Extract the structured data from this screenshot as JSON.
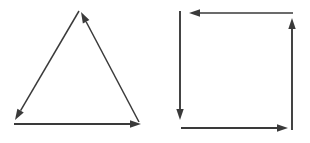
{
  "figure": {
    "background_color": "#ffffff",
    "stroke_color": "#3a3a3a",
    "width": 310,
    "height": 143,
    "panels": [
      {
        "name": "triangle-vector-loop",
        "shape": "triangle",
        "orientation": "counterclockwise",
        "vertices": [
          {
            "label": "apex",
            "x": 80,
            "y": 10
          },
          {
            "label": "bottom-left",
            "x": 14,
            "y": 124
          },
          {
            "label": "bottom-right",
            "x": 141,
            "y": 124
          }
        ],
        "vectors": [
          {
            "name": "bottom-edge-vector",
            "from_x": 14,
            "from_y": 124,
            "to_x": 141,
            "to_y": 124,
            "direction": "right",
            "arrow_at": "end",
            "stroke_width": 2.1
          },
          {
            "name": "right-edge-vector",
            "from_x": 139,
            "from_y": 122,
            "to_x": 81,
            "to_y": 12,
            "direction": "up-left",
            "arrow_at": "end",
            "stroke_width": 1.5
          },
          {
            "name": "left-edge-vector",
            "from_x": 79,
            "from_y": 11,
            "to_x": 15,
            "to_y": 120,
            "direction": "down-left",
            "arrow_at": "end",
            "stroke_width": 1.5
          }
        ]
      },
      {
        "name": "square-vector-loop",
        "shape": "square",
        "orientation": "counterclockwise",
        "vertices": [
          {
            "label": "top-left",
            "x": 180,
            "y": 12
          },
          {
            "label": "top-right",
            "x": 293,
            "y": 12
          },
          {
            "label": "bottom-right",
            "x": 293,
            "y": 129
          },
          {
            "label": "bottom-left",
            "x": 180,
            "y": 129
          }
        ],
        "vectors": [
          {
            "name": "bottom-edge-vector",
            "from_x": 181,
            "from_y": 128,
            "to_x": 288,
            "to_y": 128,
            "direction": "right",
            "arrow_at": "end",
            "stroke_width": 1.9
          },
          {
            "name": "right-edge-vector",
            "from_x": 292,
            "from_y": 130,
            "to_x": 292,
            "to_y": 18,
            "direction": "up",
            "arrow_at": "end",
            "stroke_width": 1.9
          },
          {
            "name": "top-edge-vector",
            "from_x": 293,
            "from_y": 13,
            "to_x": 189,
            "to_y": 13,
            "direction": "left",
            "arrow_at": "end",
            "stroke_width": 1.7
          },
          {
            "name": "left-edge-vector",
            "from_x": 180,
            "from_y": 11,
            "to_x": 180,
            "to_y": 120,
            "direction": "down",
            "arrow_at": "end",
            "stroke_width": 1.9
          }
        ]
      }
    ]
  }
}
